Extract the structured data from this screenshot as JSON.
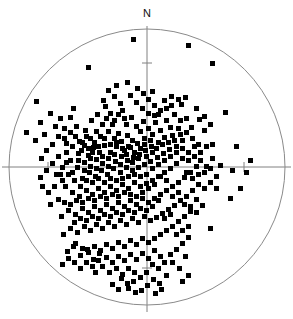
{
  "figure": {
    "type": "stereonet-scatter",
    "north_label": "N",
    "background_color": "#ffffff",
    "marker_color": "#000000",
    "axis_color": "#808080",
    "circle_color": "#8a8a8a"
  },
  "chart_data": {
    "type": "scatter",
    "title": "",
    "subtitle": "",
    "xlabel": "",
    "ylabel": "",
    "grid": false,
    "legend": "none",
    "annotations": [
      {
        "text": "N",
        "x": 147,
        "y": 14,
        "role": "north-direction-label"
      }
    ],
    "projection": {
      "shape": "circle",
      "center_x": 147,
      "center_y": 167,
      "radius": 138,
      "axis_lines": [
        "horizontal",
        "vertical"
      ],
      "ticks": [
        {
          "axis": "vertical",
          "x": 147,
          "y": 63
        },
        {
          "axis": "vertical",
          "x": 147,
          "y": 268
        },
        {
          "axis": "horizontal",
          "x": 48,
          "y": 167
        },
        {
          "axis": "horizontal",
          "x": 244,
          "y": 167
        }
      ]
    },
    "xlim": [
      0,
      293
    ],
    "ylim": [
      0,
      319
    ],
    "marker": {
      "shape": "square",
      "size": 5,
      "color": "#000000"
    },
    "n_points": 332,
    "points": [
      [
        133,
        39
      ],
      [
        188,
        45
      ],
      [
        212,
        63
      ],
      [
        88,
        67
      ],
      [
        116,
        85
      ],
      [
        36,
        101
      ],
      [
        127,
        82
      ],
      [
        152,
        91
      ],
      [
        171,
        96
      ],
      [
        178,
        99
      ],
      [
        185,
        97
      ],
      [
        181,
        104
      ],
      [
        171,
        105
      ],
      [
        164,
        100
      ],
      [
        160,
        110
      ],
      [
        148,
        113
      ],
      [
        154,
        115
      ],
      [
        26,
        132
      ],
      [
        35,
        140
      ],
      [
        73,
        108
      ],
      [
        70,
        117
      ],
      [
        103,
        100
      ],
      [
        105,
        106
      ],
      [
        97,
        114
      ],
      [
        91,
        120
      ],
      [
        85,
        130
      ],
      [
        79,
        141
      ],
      [
        75,
        136
      ],
      [
        66,
        143
      ],
      [
        110,
        113
      ],
      [
        114,
        120
      ],
      [
        122,
        110
      ],
      [
        126,
        124
      ],
      [
        118,
        133
      ],
      [
        131,
        117
      ],
      [
        136,
        126
      ],
      [
        140,
        131
      ],
      [
        127,
        135
      ],
      [
        121,
        141
      ],
      [
        132,
        140
      ],
      [
        143,
        121
      ],
      [
        148,
        128
      ],
      [
        152,
        134
      ],
      [
        144,
        138
      ],
      [
        137,
        143
      ],
      [
        130,
        147
      ],
      [
        124,
        150
      ],
      [
        116,
        146
      ],
      [
        110,
        152
      ],
      [
        104,
        145
      ],
      [
        99,
        152
      ],
      [
        93,
        147
      ],
      [
        88,
        155
      ],
      [
        81,
        150
      ],
      [
        155,
        122
      ],
      [
        160,
        130
      ],
      [
        166,
        120
      ],
      [
        170,
        127
      ],
      [
        164,
        137
      ],
      [
        158,
        142
      ],
      [
        151,
        146
      ],
      [
        145,
        150
      ],
      [
        139,
        154
      ],
      [
        133,
        157
      ],
      [
        127,
        160
      ],
      [
        121,
        156
      ],
      [
        115,
        161
      ],
      [
        108,
        158
      ],
      [
        102,
        163
      ],
      [
        96,
        159
      ],
      [
        90,
        166
      ],
      [
        84,
        162
      ],
      [
        77,
        167
      ],
      [
        70,
        160
      ],
      [
        172,
        135
      ],
      [
        178,
        128
      ],
      [
        182,
        140
      ],
      [
        176,
        146
      ],
      [
        169,
        149
      ],
      [
        163,
        153
      ],
      [
        157,
        157
      ],
      [
        150,
        161
      ],
      [
        144,
        164
      ],
      [
        138,
        167
      ],
      [
        132,
        170
      ],
      [
        126,
        167
      ],
      [
        120,
        172
      ],
      [
        113,
        168
      ],
      [
        107,
        174
      ],
      [
        101,
        170
      ],
      [
        95,
        176
      ],
      [
        89,
        172
      ],
      [
        82,
        178
      ],
      [
        62,
        167
      ],
      [
        186,
        118
      ],
      [
        191,
        127
      ],
      [
        196,
        108
      ],
      [
        199,
        119
      ],
      [
        204,
        130
      ],
      [
        188,
        152
      ],
      [
        194,
        146
      ],
      [
        182,
        158
      ],
      [
        176,
        163
      ],
      [
        170,
        168
      ],
      [
        164,
        172
      ],
      [
        158,
        176
      ],
      [
        152,
        180
      ],
      [
        146,
        183
      ],
      [
        140,
        186
      ],
      [
        134,
        182
      ],
      [
        128,
        188
      ],
      [
        122,
        184
      ],
      [
        116,
        190
      ],
      [
        110,
        186
      ],
      [
        104,
        192
      ],
      [
        98,
        188
      ],
      [
        92,
        194
      ],
      [
        86,
        190
      ],
      [
        79,
        196
      ],
      [
        72,
        192
      ],
      [
        65,
        186
      ],
      [
        58,
        199
      ],
      [
        50,
        204
      ],
      [
        200,
        152
      ],
      [
        206,
        146
      ],
      [
        212,
        158
      ],
      [
        196,
        166
      ],
      [
        190,
        172
      ],
      [
        184,
        177
      ],
      [
        178,
        182
      ],
      [
        172,
        186
      ],
      [
        166,
        190
      ],
      [
        160,
        194
      ],
      [
        154,
        198
      ],
      [
        148,
        202
      ],
      [
        142,
        198
      ],
      [
        136,
        204
      ],
      [
        130,
        200
      ],
      [
        124,
        206
      ],
      [
        118,
        202
      ],
      [
        112,
        208
      ],
      [
        106,
        204
      ],
      [
        100,
        210
      ],
      [
        94,
        206
      ],
      [
        88,
        212
      ],
      [
        82,
        208
      ],
      [
        75,
        214
      ],
      [
        68,
        210
      ],
      [
        61,
        216
      ],
      [
        225,
        112
      ],
      [
        220,
        165
      ],
      [
        232,
        170
      ],
      [
        216,
        176
      ],
      [
        210,
        182
      ],
      [
        204,
        188
      ],
      [
        198,
        184
      ],
      [
        192,
        190
      ],
      [
        186,
        196
      ],
      [
        180,
        200
      ],
      [
        174,
        205
      ],
      [
        168,
        209
      ],
      [
        162,
        213
      ],
      [
        156,
        217
      ],
      [
        150,
        220
      ],
      [
        144,
        216
      ],
      [
        138,
        222
      ],
      [
        132,
        218
      ],
      [
        126,
        224
      ],
      [
        120,
        220
      ],
      [
        114,
        226
      ],
      [
        108,
        222
      ],
      [
        102,
        228
      ],
      [
        96,
        224
      ],
      [
        90,
        230
      ],
      [
        84,
        226
      ],
      [
        77,
        232
      ],
      [
        70,
        228
      ],
      [
        63,
        234
      ],
      [
        196,
        199
      ],
      [
        202,
        205
      ],
      [
        190,
        211
      ],
      [
        184,
        216
      ],
      [
        178,
        221
      ],
      [
        172,
        226
      ],
      [
        166,
        230
      ],
      [
        160,
        234
      ],
      [
        154,
        238
      ],
      [
        148,
        242
      ],
      [
        142,
        238
      ],
      [
        136,
        244
      ],
      [
        130,
        240
      ],
      [
        124,
        246
      ],
      [
        118,
        242
      ],
      [
        112,
        248
      ],
      [
        106,
        244
      ],
      [
        100,
        250
      ],
      [
        94,
        246
      ],
      [
        88,
        252
      ],
      [
        82,
        248
      ],
      [
        75,
        243
      ],
      [
        210,
        228
      ],
      [
        216,
        188
      ],
      [
        142,
        253
      ],
      [
        148,
        258
      ],
      [
        154,
        250
      ],
      [
        160,
        256
      ],
      [
        136,
        259
      ],
      [
        130,
        254
      ],
      [
        124,
        260
      ],
      [
        118,
        256
      ],
      [
        112,
        262
      ],
      [
        106,
        257
      ],
      [
        99,
        253
      ],
      [
        93,
        259
      ],
      [
        87,
        249
      ],
      [
        80,
        255
      ],
      [
        73,
        246
      ],
      [
        67,
        251
      ],
      [
        152,
        264
      ],
      [
        158,
        268
      ],
      [
        164,
        262
      ],
      [
        170,
        254
      ],
      [
        176,
        249
      ],
      [
        182,
        243
      ],
      [
        188,
        237
      ],
      [
        128,
        268
      ],
      [
        134,
        272
      ],
      [
        122,
        274
      ],
      [
        116,
        268
      ],
      [
        109,
        272
      ],
      [
        102,
        266
      ],
      [
        95,
        272
      ],
      [
        140,
        277
      ],
      [
        146,
        272
      ],
      [
        133,
        281
      ],
      [
        127,
        283
      ],
      [
        121,
        278
      ],
      [
        172,
        262
      ],
      [
        166,
        275
      ],
      [
        179,
        268
      ],
      [
        185,
        256
      ],
      [
        147,
        285
      ],
      [
        153,
        279
      ],
      [
        159,
        283
      ],
      [
        74,
        262
      ],
      [
        80,
        268
      ],
      [
        68,
        258
      ],
      [
        62,
        264
      ],
      [
        86,
        262
      ],
      [
        92,
        266
      ],
      [
        98,
        260
      ],
      [
        188,
        275
      ],
      [
        182,
        281
      ],
      [
        141,
        290
      ],
      [
        135,
        292
      ],
      [
        128,
        288
      ],
      [
        118,
        289
      ],
      [
        112,
        284
      ],
      [
        155,
        293
      ],
      [
        161,
        289
      ],
      [
        40,
        122
      ],
      [
        44,
        134
      ],
      [
        55,
        126
      ],
      [
        60,
        118
      ],
      [
        50,
        113
      ],
      [
        64,
        128
      ],
      [
        58,
        136
      ],
      [
        52,
        144
      ],
      [
        46,
        150
      ],
      [
        41,
        158
      ],
      [
        66,
        152
      ],
      [
        72,
        146
      ],
      [
        78,
        153
      ],
      [
        84,
        145
      ],
      [
        90,
        138
      ],
      [
        96,
        131
      ],
      [
        102,
        124
      ],
      [
        108,
        131
      ],
      [
        114,
        138
      ],
      [
        120,
        103
      ],
      [
        114,
        96
      ],
      [
        108,
        90
      ],
      [
        130,
        95
      ],
      [
        136,
        102
      ],
      [
        142,
        108
      ],
      [
        148,
        99
      ],
      [
        154,
        105
      ],
      [
        143,
        93
      ],
      [
        137,
        88
      ],
      [
        158,
        114
      ],
      [
        166,
        108
      ],
      [
        174,
        114
      ],
      [
        180,
        120
      ],
      [
        186,
        132
      ],
      [
        192,
        138
      ],
      [
        198,
        144
      ],
      [
        204,
        116
      ],
      [
        210,
        124
      ],
      [
        58,
        156
      ],
      [
        52,
        163
      ],
      [
        46,
        170
      ],
      [
        40,
        177
      ],
      [
        56,
        174
      ],
      [
        62,
        180
      ],
      [
        68,
        174
      ],
      [
        74,
        180
      ],
      [
        80,
        186
      ],
      [
        86,
        180
      ],
      [
        92,
        182
      ],
      [
        98,
        178
      ],
      [
        104,
        182
      ],
      [
        110,
        178
      ],
      [
        116,
        180
      ],
      [
        122,
        178
      ],
      [
        128,
        176
      ],
      [
        134,
        174
      ],
      [
        140,
        176
      ],
      [
        146,
        174
      ],
      [
        152,
        168
      ],
      [
        158,
        164
      ],
      [
        164,
        160
      ],
      [
        170,
        156
      ],
      [
        176,
        152
      ],
      [
        182,
        148
      ],
      [
        188,
        160
      ],
      [
        194,
        156
      ],
      [
        200,
        160
      ],
      [
        206,
        166
      ],
      [
        212,
        144
      ],
      [
        236,
        146
      ],
      [
        240,
        188
      ],
      [
        246,
        172
      ],
      [
        250,
        160
      ],
      [
        230,
        198
      ],
      [
        118,
        114
      ],
      [
        124,
        118
      ],
      [
        112,
        124
      ],
      [
        106,
        118
      ],
      [
        100,
        136
      ],
      [
        94,
        142
      ],
      [
        88,
        148
      ],
      [
        82,
        142
      ],
      [
        76,
        126
      ],
      [
        70,
        132
      ],
      [
        64,
        138
      ],
      [
        144,
        144
      ],
      [
        150,
        140
      ],
      [
        156,
        148
      ],
      [
        162,
        144
      ],
      [
        168,
        142
      ],
      [
        174,
        140
      ],
      [
        180,
        134
      ],
      [
        186,
        172
      ],
      [
        192,
        178
      ],
      [
        198,
        174
      ],
      [
        204,
        172
      ],
      [
        210,
        168
      ],
      [
        132,
        162
      ],
      [
        138,
        158
      ],
      [
        126,
        154
      ],
      [
        120,
        164
      ],
      [
        114,
        154
      ],
      [
        108,
        166
      ],
      [
        102,
        156
      ],
      [
        96,
        168
      ],
      [
        90,
        158
      ],
      [
        84,
        170
      ],
      [
        78,
        160
      ],
      [
        72,
        172
      ],
      [
        66,
        162
      ],
      [
        60,
        174
      ],
      [
        54,
        186
      ],
      [
        48,
        192
      ],
      [
        42,
        186
      ],
      [
        146,
        156
      ],
      [
        152,
        152
      ],
      [
        140,
        148
      ],
      [
        134,
        152
      ],
      [
        128,
        146
      ],
      [
        122,
        148
      ],
      [
        116,
        142
      ],
      [
        110,
        144
      ],
      [
        104,
        138
      ],
      [
        98,
        146
      ],
      [
        92,
        152
      ],
      [
        86,
        136
      ],
      [
        160,
        176
      ],
      [
        166,
        180
      ],
      [
        154,
        184
      ],
      [
        148,
        188
      ],
      [
        142,
        192
      ],
      [
        136,
        196
      ],
      [
        130,
        194
      ],
      [
        124,
        192
      ],
      [
        118,
        196
      ],
      [
        112,
        194
      ],
      [
        106,
        198
      ],
      [
        100,
        196
      ],
      [
        94,
        200
      ],
      [
        88,
        198
      ],
      [
        82,
        202
      ],
      [
        76,
        200
      ],
      [
        70,
        204
      ],
      [
        64,
        202
      ],
      [
        172,
        196
      ],
      [
        178,
        192
      ],
      [
        184,
        204
      ],
      [
        190,
        206
      ],
      [
        196,
        212
      ],
      [
        158,
        200
      ],
      [
        152,
        206
      ],
      [
        146,
        210
      ],
      [
        140,
        208
      ],
      [
        134,
        212
      ],
      [
        128,
        210
      ],
      [
        122,
        214
      ],
      [
        116,
        212
      ],
      [
        110,
        216
      ],
      [
        104,
        214
      ],
      [
        98,
        218
      ],
      [
        92,
        216
      ],
      [
        86,
        220
      ],
      [
        80,
        218
      ],
      [
        74,
        222
      ],
      [
        164,
        218
      ],
      [
        170,
        214
      ],
      [
        176,
        234
      ],
      [
        182,
        230
      ],
      [
        188,
        226
      ]
    ]
  }
}
